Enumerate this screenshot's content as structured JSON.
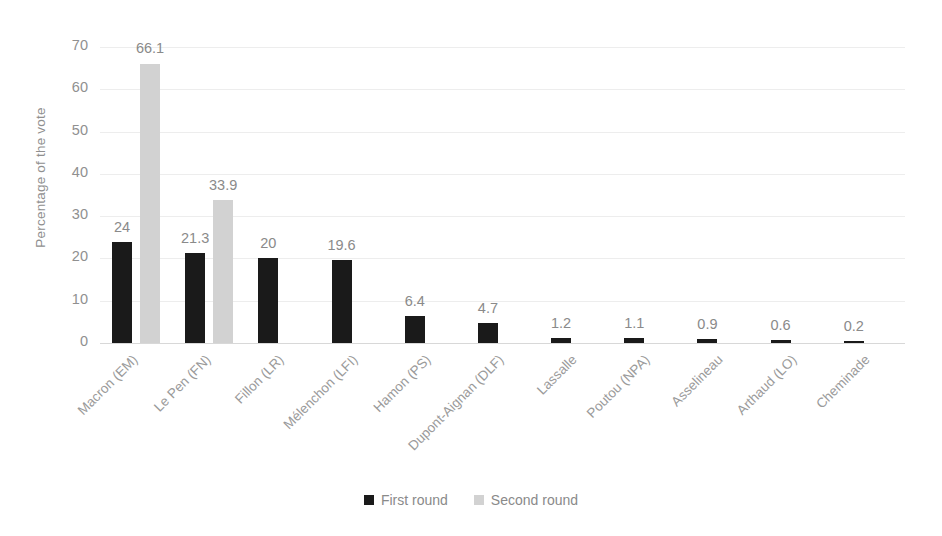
{
  "chart_data": {
    "type": "bar",
    "title": "",
    "xlabel": "",
    "ylabel": "Percentage of the vote",
    "ylim": [
      0,
      70
    ],
    "yticks": [
      0,
      10,
      20,
      30,
      40,
      50,
      60,
      70
    ],
    "grid": true,
    "legend_position": "bottom-center",
    "categories": [
      "Macron (EM)",
      "Le Pen (FN)",
      "Fillon (LR)",
      "Mélenchon (LFI)",
      "Hamon (PS)",
      "Dupont-Aignan (DLF)",
      "Lassalle",
      "Poutou (NPA)",
      "Asselineau",
      "Arthaud (LO)",
      "Cheminade"
    ],
    "series": [
      {
        "name": "First round",
        "color": "#1a1a1a",
        "values": [
          24,
          21.3,
          20,
          19.6,
          6.4,
          4.7,
          1.2,
          1.1,
          0.9,
          0.6,
          0.2
        ],
        "labels": [
          "24",
          "21.3",
          "20",
          "19.6",
          "6.4",
          "4.7",
          "1.2",
          "1.1",
          "0.9",
          "0.6",
          "0.2"
        ]
      },
      {
        "name": "Second round",
        "color": "#d2d2d2",
        "values": [
          66.1,
          33.9,
          null,
          null,
          null,
          null,
          null,
          null,
          null,
          null,
          null
        ],
        "labels": [
          "66.1",
          "33.9",
          "",
          "",
          "",
          "",
          "",
          "",
          "",
          "",
          ""
        ]
      }
    ]
  },
  "legend": {
    "items": [
      {
        "label": "First round",
        "color": "#1a1a1a"
      },
      {
        "label": "Second round",
        "color": "#d2d2d2"
      }
    ]
  }
}
